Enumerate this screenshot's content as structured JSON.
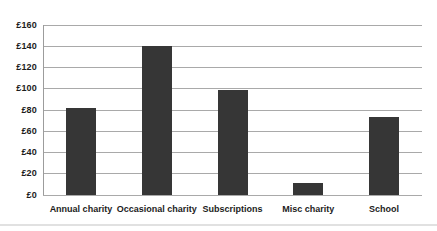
{
  "chart_data": {
    "type": "bar",
    "title": "",
    "xlabel": "",
    "ylabel": "",
    "categories": [
      "Annual charity",
      "Occasional charity",
      "Subscriptions",
      "Misc charity",
      "School"
    ],
    "values": [
      82,
      140,
      99,
      11,
      73
    ],
    "ylim": [
      0,
      160
    ],
    "ytick_interval": 20,
    "ytick_labels": [
      "£0",
      "£20",
      "£40",
      "£60",
      "£80",
      "£100",
      "£120",
      "£140",
      "£160"
    ],
    "grid": true,
    "legend": "none",
    "currency_prefix": "£",
    "colors": {
      "bar": "#363636",
      "gridline": "#a9a9a9",
      "axis": "#9c9c9c",
      "text": "#1c1c1c",
      "background": "#ffffff"
    }
  }
}
